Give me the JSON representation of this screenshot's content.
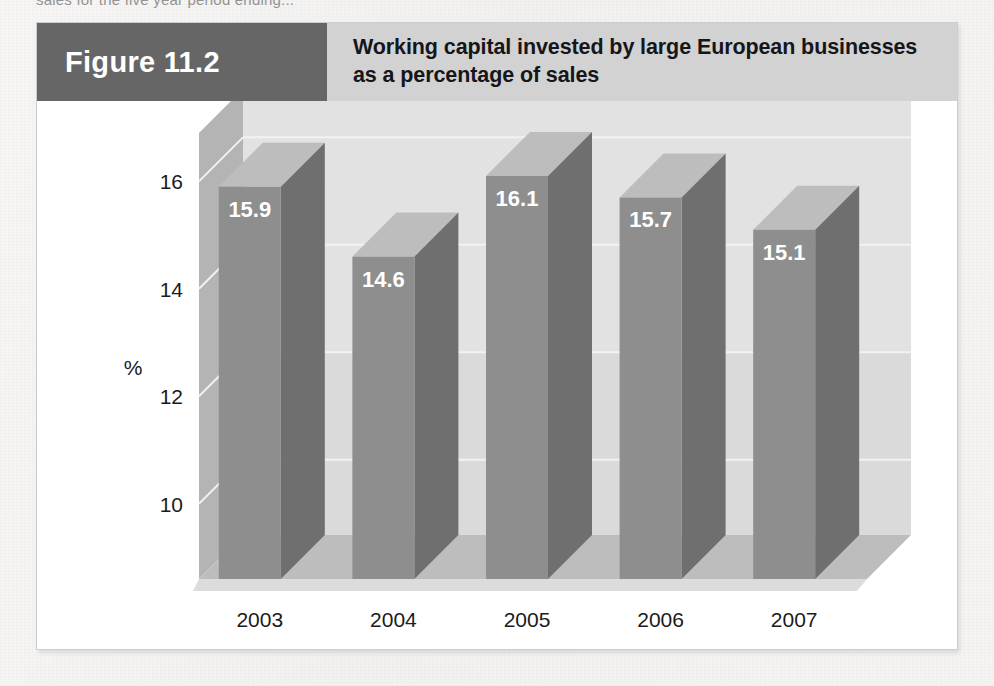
{
  "page": {
    "cut_off_text": "sales for the five year period ending...",
    "background_color": "#f4f3f1"
  },
  "figure": {
    "number_label": "Figure 11.2",
    "title_line1": "Working capital invested by large European businesses",
    "title_line2": "as a percentage of sales",
    "number_block_color": "#666666",
    "banner_color": "#d2d2d2",
    "frame_color": "#ffffff"
  },
  "chart_data": {
    "type": "bar",
    "title": "Working capital invested by large European businesses as a percentage of sales",
    "subtitle": "",
    "categories": [
      "2003",
      "2004",
      "2005",
      "2006",
      "2007"
    ],
    "values": [
      15.9,
      14.6,
      16.1,
      15.7,
      15.1
    ],
    "value_labels": [
      "15.9",
      "14.6",
      "16.1",
      "15.7",
      "15.1"
    ],
    "xlabel": "Year",
    "ylabel": "%",
    "ylim": [
      8.6,
      16.9
    ],
    "yticks": [
      16,
      14,
      12,
      10
    ],
    "ytick_labels": [
      "16",
      "14",
      "12",
      "10"
    ],
    "grid": true,
    "legend": "none",
    "three_d": true,
    "colors": {
      "bar_front": "#8e8e8e",
      "bar_side": "#6f6f6f",
      "bar_top": "#bdbdbd",
      "back_wall": "#e2e2e2",
      "back_wall_lower": "#d4d4d4",
      "left_wall": "#b4b4b4",
      "floor": "#bdbdbd",
      "gridline": "#f2f2f2",
      "label_text": "#ffffff",
      "axis_text": "#1b1b1b"
    }
  }
}
